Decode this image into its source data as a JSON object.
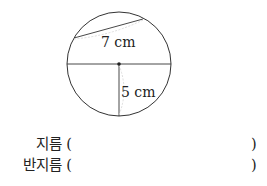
{
  "figure": {
    "shape": "circle",
    "center": [
      119,
      64
    ],
    "radius": 52,
    "chord_label": "7 cm",
    "radius_label": "5 cm",
    "stroke_color": "#333333",
    "hint_color": "#c8c8c8"
  },
  "questions": [
    {
      "label": "지름 (",
      "close": ")"
    },
    {
      "label": "반지름 (",
      "close": ")"
    }
  ]
}
